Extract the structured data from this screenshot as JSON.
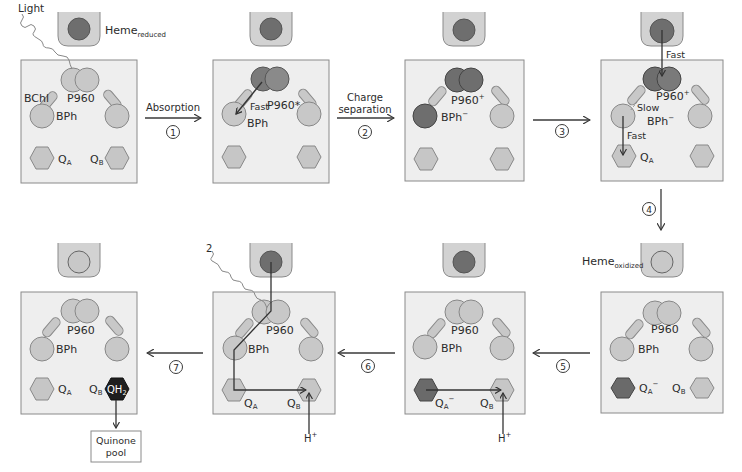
{
  "colors": {
    "panel_bg": "#eeeeee",
    "panel_border": "#8a8a8a",
    "light_pigment": "#c8c8c8",
    "dark_pigment": "#6e6e6e",
    "quinone_light": "#c6c6c6",
    "quinone_dark": "#6a6a6a",
    "qh2": "#1e1e1e",
    "arrow": "#3a3a3a",
    "text": "#2b2b2b"
  },
  "labels": {
    "light": "Light",
    "light2": "2",
    "heme_reduced": "Heme",
    "heme_reduced_sub": "reduced",
    "heme_oxidized": "Heme",
    "heme_oxidized_sub": "oxidized",
    "bchl": "BChl",
    "p960": "P960",
    "p960_excited": "P960*",
    "p960_plus": "P960",
    "plus": "+",
    "bph": "BPh",
    "bph_minus": "BPh",
    "minus": "−",
    "q": "Q",
    "a": "A",
    "b": "B",
    "qh2": "QH",
    "two": "2",
    "fast": "Fast",
    "slow": "Slow",
    "h": "H",
    "quinone_pool_1": "Quinone",
    "quinone_pool_2": "pool"
  },
  "steps": [
    {
      "num": "1",
      "label_1": "Absorption",
      "label_2": ""
    },
    {
      "num": "2",
      "label_1": "Charge",
      "label_2": "separation"
    },
    {
      "num": "3",
      "label_1": "",
      "label_2": ""
    },
    {
      "num": "4",
      "label_1": "",
      "label_2": ""
    },
    {
      "num": "5",
      "label_1": "",
      "label_2": ""
    },
    {
      "num": "6",
      "label_1": "",
      "label_2": ""
    },
    {
      "num": "7",
      "label_1": "",
      "label_2": ""
    }
  ]
}
